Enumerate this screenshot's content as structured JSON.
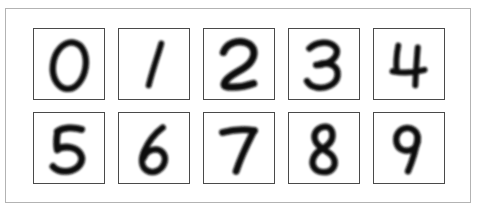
{
  "figure": {
    "panel_background": "#ffffff",
    "panel_border_color": "#b3b3b3",
    "cell_border_color": "#4a4a4a",
    "ink_color": "#0a0a0a",
    "blur_amount": 1.35,
    "grid": {
      "columns": 5,
      "rows": 2,
      "cell_size_px": 72,
      "column_gap_px": 13,
      "row_gap_px": 12
    }
  },
  "digits": [
    {
      "index": 0,
      "label": "0",
      "name": "digit-zero",
      "row": 1,
      "column": 1,
      "stroke_width": 6.5,
      "paths": [
        "M41 14 C31 12 21 23 19.5 37 C18 50 24.5 60 33 61.5 C42 63 51 53 53 39.5 C55 26 49.5 15.5 41 14 Z"
      ]
    },
    {
      "index": 1,
      "label": "1",
      "name": "digit-one",
      "row": 1,
      "column": 2,
      "stroke_width": 6,
      "paths": [
        "M43.5 15 C40 27 35 41 30.5 58"
      ]
    },
    {
      "index": 2,
      "label": "2",
      "name": "digit-two",
      "row": 1,
      "column": 3,
      "stroke_width": 7.5,
      "paths": [
        "M20 24 C23 15 34 11 43 14 C52.5 17 54 27 47 35 C41 42 30 45 23.5 52 C19.5 56.5 20 59 24 59.5 C33 60.5 43 59 51 56"
      ]
    },
    {
      "index": 3,
      "label": "3",
      "name": "digit-three",
      "row": 1,
      "column": 4,
      "stroke_width": 6.5,
      "paths": [
        "M21 20 C28 13 41 12 47 18 C52 23 48.5 31 40 34.5 C35.5 36.5 31 37 28 37",
        "M33 35.5 C43 34 51 39 50 48 C49 57 38 62 28 60 C23.5 59 20 56.5 18.5 53.5"
      ]
    },
    {
      "index": 4,
      "label": "4",
      "name": "digit-four",
      "row": 1,
      "column": 5,
      "stroke_width": 6,
      "paths": [
        "M25 17 C23 27 22.5 36 23.5 43",
        "M19 43.5 C29 45.5 41 45 52 42",
        "M45 19 C44 31 43 44 42.5 58"
      ]
    },
    {
      "index": 5,
      "label": "5",
      "name": "digit-five",
      "row": 2,
      "column": 1,
      "stroke_width": 7,
      "paths": [
        "M49 17 C40 14 30 15 24 19",
        "M24.5 19 C23 26 23 32.5 24 38",
        "M24 37 C33 33 44 35 48 42.5 C52 50.5 45 59 34 60 C28 60.5 22.5 58.5 19.5 55"
      ]
    },
    {
      "index": 6,
      "label": "6",
      "name": "digit-six",
      "row": 2,
      "column": 2,
      "stroke_width": 6.5,
      "paths": [
        "M45 15 C37 21 30 30 26 39 C22 48 23 56 29.5 59.5 C36 63 45 58.5 47 50 C48.5 43 44 37.5 37.5 37.5 C32 37.5 27 41 25.5 46"
      ]
    },
    {
      "index": 7,
      "label": "7",
      "name": "digit-seven",
      "row": 2,
      "column": 3,
      "stroke_width": 7,
      "paths": [
        "M19 20 C30 17 41 16.5 52 18",
        "M51.5 18 C46 29 39 42 33 60"
      ]
    },
    {
      "index": 8,
      "label": "8",
      "name": "digit-eight",
      "row": 2,
      "column": 4,
      "stroke_width": 6.5,
      "paths": [
        "M38 14 C30 14 25 20 26.5 27 C28 34 36 37.5 41 41 C47 45 49 52 45 57 C40.5 62.5 30 62 26 56.5 C22 51 25 43 31 39 C36.5 35.5 43.5 32 44.5 25.5 C45.5 19 43 14.5 38 14 Z"
      ]
    },
    {
      "index": 9,
      "label": "9",
      "name": "digit-nine",
      "row": 2,
      "column": 5,
      "stroke_width": 6.5,
      "paths": [
        "M45 26 C45 19 39 14.5 32.5 15.5 C26 16.5 22 22.5 23 29.5 C24 36.5 30 40 36.5 38.5 C41 37.5 44 34 45 29.5",
        "M45 25 C43.5 36 40 48 35 60"
      ]
    }
  ]
}
